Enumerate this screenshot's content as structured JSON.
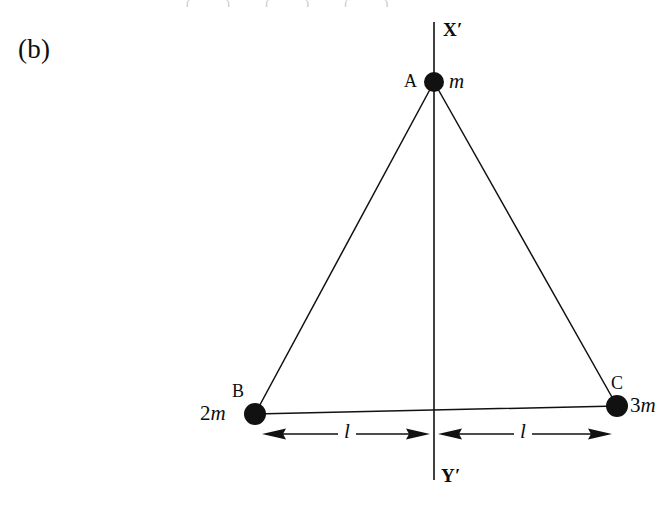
{
  "figure": {
    "panel_label": "(b)",
    "background_color": "#ffffff",
    "ink_color": "#111111",
    "width": 666,
    "height": 505,
    "caption_fragment": "( )    ( )    ( )"
  },
  "axis": {
    "top_label": "X′",
    "bottom_label": "Y′",
    "x": 434,
    "y_top": 22,
    "y_bottom": 480
  },
  "vertices": [
    {
      "id": "A",
      "name_label": "A",
      "mass_label": "m",
      "mass_prefix": "",
      "mass_symbol": "m",
      "x": 434,
      "y": 82,
      "radius": 10,
      "name_side": "left",
      "mass_side": "right"
    },
    {
      "id": "B",
      "name_label": "B",
      "mass_label": "2m",
      "mass_prefix": "2",
      "mass_symbol": "m",
      "x": 255,
      "y": 414,
      "radius": 11,
      "name_side": "above-left",
      "mass_side": "left"
    },
    {
      "id": "C",
      "name_label": "C",
      "mass_label": "3m",
      "mass_prefix": "3",
      "mass_symbol": "m",
      "x": 617,
      "y": 406,
      "radius": 11,
      "name_side": "above-right",
      "mass_side": "right"
    }
  ],
  "edges": [
    {
      "from": "A",
      "to": "B"
    },
    {
      "from": "A",
      "to": "C"
    },
    {
      "from": "B",
      "to": "C"
    }
  ],
  "dimensions": [
    {
      "id": "left-span",
      "label": "l",
      "from_x": 262,
      "to_x": 430,
      "y": 434,
      "label_x": 347,
      "label_y": 424
    },
    {
      "id": "right-span",
      "label": "l",
      "from_x": 438,
      "to_x": 612,
      "y": 434,
      "label_x": 523,
      "label_y": 424
    }
  ],
  "chart_data": {
    "type": "diagram",
    "points": [
      {
        "label": "A",
        "mass": "m",
        "x": 434,
        "y": 82
      },
      {
        "label": "B",
        "mass": "2m",
        "x": 255,
        "y": 414
      },
      {
        "label": "C",
        "mass": "3m",
        "x": 617,
        "y": 406
      }
    ],
    "axis_labels": [
      "X′",
      "Y′"
    ],
    "distance_labels": [
      "l",
      "l"
    ]
  }
}
